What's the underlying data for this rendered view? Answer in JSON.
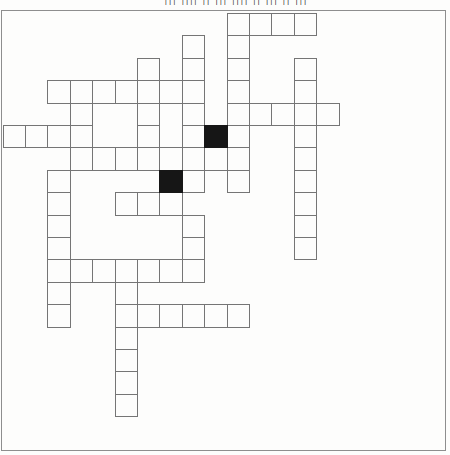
{
  "page": {
    "top_marks": "||| |||| || ||| |||| || ||| || |||",
    "background": "#fdfdfc",
    "sheet_border_color": "#8e8e8e"
  },
  "grid": {
    "origin_x": 2.6,
    "origin_y": 13.0,
    "cell_size": 22.4,
    "line_color": "#757575",
    "black_fill": "#161616",
    "white_cells": [
      [
        10,
        0
      ],
      [
        11,
        0
      ],
      [
        12,
        0
      ],
      [
        13,
        0
      ],
      [
        8,
        1
      ],
      [
        10,
        1
      ],
      [
        6,
        2
      ],
      [
        8,
        2
      ],
      [
        10,
        2
      ],
      [
        13,
        2
      ],
      [
        2,
        3
      ],
      [
        3,
        3
      ],
      [
        4,
        3
      ],
      [
        5,
        3
      ],
      [
        6,
        3
      ],
      [
        7,
        3
      ],
      [
        8,
        3
      ],
      [
        10,
        3
      ],
      [
        13,
        3
      ],
      [
        3,
        4
      ],
      [
        6,
        4
      ],
      [
        8,
        4
      ],
      [
        10,
        4
      ],
      [
        11,
        4
      ],
      [
        12,
        4
      ],
      [
        13,
        4
      ],
      [
        14,
        4
      ],
      [
        0,
        5
      ],
      [
        1,
        5
      ],
      [
        2,
        5
      ],
      [
        3,
        5
      ],
      [
        6,
        5
      ],
      [
        8,
        5
      ],
      [
        10,
        5
      ],
      [
        13,
        5
      ],
      [
        3,
        6
      ],
      [
        4,
        6
      ],
      [
        5,
        6
      ],
      [
        6,
        6
      ],
      [
        7,
        6
      ],
      [
        8,
        6
      ],
      [
        9,
        6
      ],
      [
        10,
        6
      ],
      [
        13,
        6
      ],
      [
        2,
        7
      ],
      [
        8,
        7
      ],
      [
        10,
        7
      ],
      [
        13,
        7
      ],
      [
        2,
        8
      ],
      [
        5,
        8
      ],
      [
        6,
        8
      ],
      [
        7,
        8
      ],
      [
        13,
        8
      ],
      [
        2,
        9
      ],
      [
        8,
        9
      ],
      [
        13,
        9
      ],
      [
        2,
        10
      ],
      [
        8,
        10
      ],
      [
        13,
        10
      ],
      [
        2,
        11
      ],
      [
        3,
        11
      ],
      [
        4,
        11
      ],
      [
        5,
        11
      ],
      [
        6,
        11
      ],
      [
        7,
        11
      ],
      [
        8,
        11
      ],
      [
        2,
        12
      ],
      [
        5,
        12
      ],
      [
        2,
        13
      ],
      [
        5,
        13
      ],
      [
        6,
        13
      ],
      [
        7,
        13
      ],
      [
        8,
        13
      ],
      [
        9,
        13
      ],
      [
        10,
        13
      ],
      [
        5,
        14
      ],
      [
        5,
        15
      ],
      [
        5,
        16
      ],
      [
        5,
        17
      ]
    ],
    "black_cells": [
      [
        9,
        5
      ],
      [
        7,
        7
      ]
    ]
  }
}
